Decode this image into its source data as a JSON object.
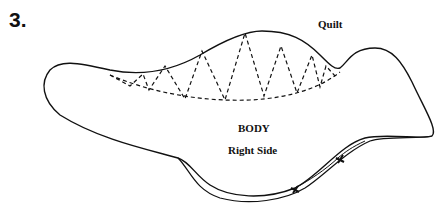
{
  "figure": {
    "step_number": "3.",
    "labels": {
      "quilt": "Quilt",
      "body": "BODY",
      "right_side": "Right Side"
    },
    "colors": {
      "line": "#111111",
      "background": "#ffffff"
    }
  }
}
